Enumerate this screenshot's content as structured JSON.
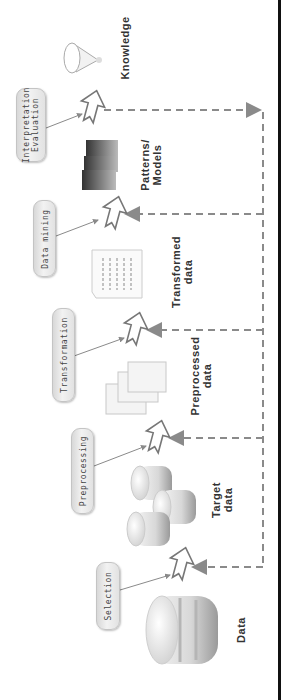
{
  "diagram": {
    "orientation": "rotated-90-ccw",
    "steps": [
      {
        "label": "Selection",
        "line1": "Selection"
      },
      {
        "label": "Preprocessing",
        "line1": "Preprocessing"
      },
      {
        "label": "Transformation",
        "line1": "Transformation"
      },
      {
        "label": "Data mining",
        "line1": "Data mining"
      },
      {
        "label": "Interpretation Evaluation",
        "line1": "Interpretation",
        "line2": "Evaluation"
      }
    ],
    "artifacts": [
      {
        "label": "Data",
        "line1": "Data",
        "icon": "database-icon"
      },
      {
        "label": "Target data",
        "line1": "Target",
        "line2": "data",
        "icon": "database-stack-icon"
      },
      {
        "label": "Preprocessed data",
        "line1": "Preprocessed",
        "line2": "data",
        "icon": "document-stack-icon"
      },
      {
        "label": "Transformed data",
        "line1": "Transformed",
        "line2": "data",
        "icon": "table-document-icon"
      },
      {
        "label": "Patterns/ Models",
        "line1": "Patterns/",
        "line2": "Models",
        "icon": "bar-blocks-icon"
      },
      {
        "label": "Knowledge",
        "line1": "Knowledge",
        "icon": "cone-icon"
      }
    ],
    "colors": {
      "pill_bg": "#e6e6e6",
      "arrow_stroke": "#777777",
      "dashed": "#8a8a8a",
      "border": "#111111",
      "text": "#333333"
    }
  }
}
